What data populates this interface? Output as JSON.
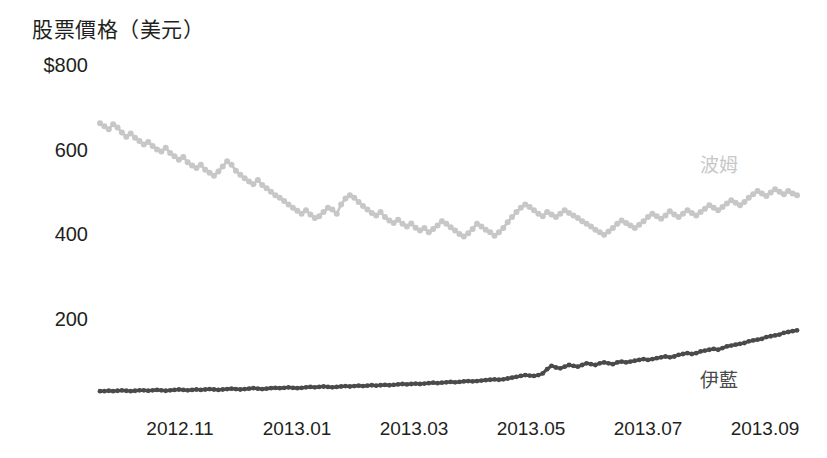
{
  "chart_data": {
    "type": "line",
    "title": "股票價格（美元）",
    "xlabel": "",
    "ylabel": "股票價格（美元）",
    "ylim": [
      0,
      800
    ],
    "xlim": [
      "2012.10",
      "2013.09"
    ],
    "grid": false,
    "legend_position": "inline-right",
    "y_ticks": [
      "$800",
      "600",
      "400",
      "200"
    ],
    "y_tick_values": [
      800,
      600,
      400,
      200
    ],
    "x_ticks": [
      "2012.11",
      "2013.01",
      "2013.03",
      "2013.05",
      "2013.07",
      "2013.09"
    ],
    "colors": {
      "bom": "#c7c7c7",
      "ilan": "#4a4a4a",
      "text": "#231f20",
      "background": "#ffffff"
    },
    "series": [
      {
        "name": "波姆",
        "color": "#c7c7c7",
        "label_position": {
          "x": 700,
          "y": 155
        },
        "values": [
          662,
          655,
          648,
          660,
          652,
          640,
          630,
          638,
          628,
          620,
          612,
          618,
          608,
          600,
          595,
          604,
          592,
          584,
          576,
          582,
          570,
          562,
          556,
          564,
          552,
          545,
          538,
          548,
          560,
          572,
          564,
          550,
          540,
          532,
          524,
          518,
          528,
          516,
          508,
          500,
          492,
          486,
          478,
          470,
          462,
          455,
          448,
          456,
          446,
          438,
          442,
          452,
          462,
          458,
          448,
          470,
          484,
          492,
          486,
          476,
          466,
          458,
          450,
          444,
          452,
          440,
          432,
          426,
          434,
          424,
          418,
          425,
          415,
          408,
          414,
          404,
          412,
          420,
          430,
          424,
          416,
          408,
          400,
          394,
          402,
          412,
          424,
          418,
          410,
          404,
          396,
          404,
          414,
          428,
          440,
          452,
          462,
          470,
          464,
          456,
          448,
          442,
          452,
          446,
          440,
          448,
          456,
          450,
          444,
          438,
          430,
          424,
          418,
          410,
          404,
          398,
          406,
          414,
          424,
          432,
          426,
          420,
          414,
          422,
          430,
          440,
          448,
          442,
          436,
          444,
          454,
          446,
          440,
          448,
          456,
          450,
          444,
          452,
          460,
          468,
          462,
          456,
          464,
          472,
          480,
          474,
          468,
          476,
          486,
          494,
          502,
          496,
          490,
          498,
          506,
          500,
          494,
          502,
          496,
          492
        ]
      },
      {
        "name": "伊藍",
        "color": "#4a4a4a",
        "label_position": {
          "x": 700,
          "y": 370
        },
        "values": [
          28,
          28,
          29,
          28,
          29,
          30,
          29,
          28,
          29,
          30,
          30,
          29,
          30,
          31,
          30,
          29,
          30,
          31,
          32,
          31,
          30,
          31,
          32,
          31,
          32,
          33,
          32,
          31,
          32,
          33,
          34,
          33,
          32,
          33,
          34,
          35,
          34,
          33,
          34,
          35,
          36,
          35,
          36,
          37,
          36,
          35,
          36,
          37,
          38,
          37,
          38,
          39,
          38,
          37,
          38,
          39,
          40,
          39,
          40,
          41,
          40,
          41,
          42,
          41,
          42,
          43,
          42,
          43,
          44,
          45,
          44,
          45,
          46,
          45,
          46,
          47,
          48,
          47,
          48,
          49,
          50,
          49,
          50,
          51,
          52,
          51,
          52,
          53,
          54,
          55,
          56,
          55,
          56,
          58,
          60,
          62,
          64,
          66,
          65,
          64,
          66,
          70,
          80,
          88,
          84,
          82,
          86,
          90,
          88,
          86,
          90,
          94,
          92,
          90,
          94,
          96,
          94,
          92,
          96,
          98,
          96,
          98,
          100,
          102,
          104,
          102,
          104,
          106,
          108,
          110,
          108,
          110,
          114,
          116,
          118,
          116,
          118,
          122,
          124,
          126,
          128,
          126,
          130,
          134,
          136,
          138,
          140,
          142,
          146,
          148,
          150,
          152,
          156,
          158,
          160,
          162,
          166,
          168,
          170,
          172
        ]
      }
    ]
  },
  "labels": {
    "bom": "波姆",
    "ilan": "伊藍"
  }
}
